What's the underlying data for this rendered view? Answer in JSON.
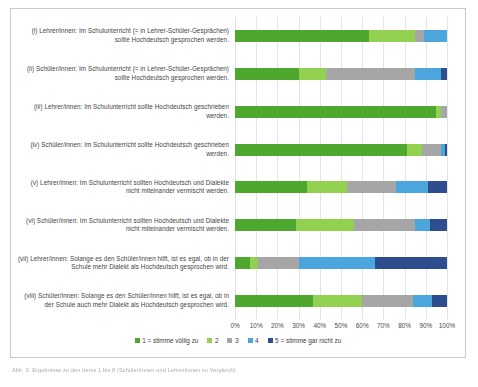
{
  "chart_data": {
    "type": "bar",
    "orientation": "horizontal",
    "stacked": true,
    "normalized": true,
    "title": "",
    "xlabel": "",
    "ylabel": "",
    "xlim": [
      0,
      100
    ],
    "grid": true,
    "legend_position": "bottom",
    "xticks": [
      "0%",
      "10%",
      "20%",
      "30%",
      "40%",
      "50%",
      "60%",
      "70%",
      "80%",
      "90%",
      "100%"
    ],
    "xtick_values": [
      0,
      10,
      20,
      30,
      40,
      50,
      60,
      70,
      80,
      90,
      100
    ],
    "categories": [
      "(i) Lehrer/innen: Im Schulunterricht (= in Lehrer-Schüler-Gesprächen) sollte Hochdeutsch gesprochen werden.",
      "(ii) Schüler/innen: Im Schulunterricht (= in Lehrer-Schüler-Gesprächen) sollte Hochdeutsch gesprochen werden.",
      "(iii) Lehrer/innen: Im Schulunterricht sollte Hochdeutsch geschrieben werden.",
      "(iv) Schüler/innen: Im Schulunterricht sollte Hochdeutsch geschrieben werden.",
      "(v) Lehrer/innen: Im Schulunterricht sollten Hochdeutsch und Dialekte nicht miteinander vermischt werden.",
      "(vi) Schüler/innen: Im Schulunterricht sollten Hochdeutsch und Dialekte nicht miteinander vermischt werden.",
      "(vii) Lehrer/innen: Solange es den Schüler/innen hilft, ist es egal, ob in der Schule mehr Dialekt als Hochdeutsch gesprochen wird.",
      "(viii) Schüler/innen: Solange es den Schüler/innen hilft, ist es egal, ob in der Schule auch mehr Dialekt als Hochdeutsch gesprochen wird."
    ],
    "series": [
      {
        "name": "1 = stimme völlig zu",
        "color": "#4EA72E",
        "values": [
          63,
          30,
          95,
          81,
          34,
          29,
          7,
          37
        ]
      },
      {
        "name": "2",
        "color": "#92D050",
        "values": [
          22,
          13,
          2,
          7,
          19,
          27,
          4,
          23
        ]
      },
      {
        "name": "3",
        "color": "#A6A6A6",
        "values": [
          4,
          42,
          3,
          9,
          23,
          29,
          19,
          24
        ]
      },
      {
        "name": "4",
        "color": "#4BA6DE",
        "values": [
          11,
          12,
          0,
          2,
          15,
          7,
          36,
          9
        ]
      },
      {
        "name": "5 = stimme gar nicht zu",
        "color": "#2E4D8E",
        "values": [
          0,
          3,
          0,
          1,
          9,
          8,
          34,
          7
        ]
      }
    ]
  },
  "caption": {
    "text": "Abb. 3: Ergebnisse zu den Items 1 bis 8 (Schüler/innen und Lehrer/innen im Vergleich)"
  }
}
